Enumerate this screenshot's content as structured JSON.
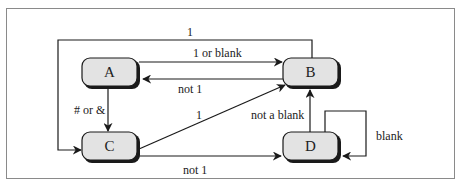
{
  "diagram": {
    "type": "state-transition",
    "nodes": [
      {
        "id": "A",
        "label": "A"
      },
      {
        "id": "B",
        "label": "B"
      },
      {
        "id": "C",
        "label": "C"
      },
      {
        "id": "D",
        "label": "D"
      }
    ],
    "edges": [
      {
        "from": "B",
        "to": "C",
        "label": "1"
      },
      {
        "from": "A",
        "to": "B",
        "label": "1 or blank"
      },
      {
        "from": "B",
        "to": "A",
        "label": "not 1"
      },
      {
        "from": "A",
        "to": "C",
        "label": "# or &"
      },
      {
        "from": "C",
        "to": "B",
        "label": "1"
      },
      {
        "from": "C",
        "to": "D",
        "label": "not 1"
      },
      {
        "from": "D",
        "to": "B",
        "label": "not a blank"
      },
      {
        "from": "D",
        "to": "D",
        "label": "blank"
      }
    ],
    "colors": {
      "node_fill": "#e3e3e3",
      "node_stroke": "#1a1a1a",
      "edge": "#1a1a1a",
      "frame": "#8a8a8a",
      "background": "#ffffff"
    }
  }
}
